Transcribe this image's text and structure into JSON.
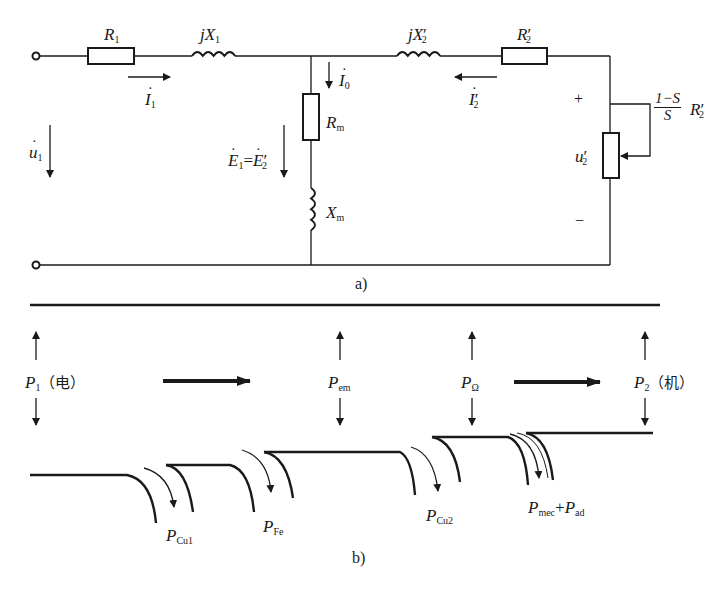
{
  "figure": {
    "part_a": {
      "caption": "a)",
      "title": "T-type equivalent circuit of induction motor",
      "components": {
        "R1": {
          "base": "R",
          "sub": "1"
        },
        "jX1": {
          "base": "jX",
          "sub": "1"
        },
        "jX2p": {
          "base": "jX",
          "sub": "2",
          "prime": "′"
        },
        "R2p": {
          "base": "R",
          "sub": "2",
          "prime": "′"
        },
        "Rm": {
          "base": "R",
          "sub": "m"
        },
        "Xm": {
          "base": "X",
          "sub": "m"
        },
        "load": {
          "num": "1−S",
          "den": "S",
          "base": "R",
          "sub": "2",
          "prime": "′"
        }
      },
      "currents": {
        "I1": {
          "base": "I",
          "sub": "1"
        },
        "I0": {
          "base": "I",
          "sub": "0"
        },
        "I2p": {
          "base": "I",
          "sub": "2",
          "prime": "′"
        }
      },
      "voltages": {
        "U1": {
          "base": "u",
          "sub": "1"
        },
        "E": {
          "lhs_base": "E",
          "lhs_sub": "1",
          "eq": "=",
          "rhs_base": "E",
          "rhs_sub": "2",
          "rhs_prime": "′"
        },
        "U2p": {
          "base": "u",
          "sub": "2",
          "prime": "′"
        },
        "plus": "+",
        "minus": "−"
      }
    },
    "part_b": {
      "caption": "b)",
      "title": "Power flow diagram",
      "nodes": [
        {
          "base": "P",
          "sub": "1",
          "note": "（电）"
        },
        {
          "base": "P",
          "sub": "em"
        },
        {
          "base": "P",
          "sub": "Ω"
        },
        {
          "base": "P",
          "sub": "2",
          "note": "（机）"
        }
      ],
      "losses": [
        {
          "base": "P",
          "sub": "Cu1"
        },
        {
          "base": "P",
          "sub": "Fe"
        },
        {
          "base": "P",
          "sub": "Cu2"
        },
        {
          "base": "P",
          "sub": "mec",
          "plus": "+",
          "base2": "P",
          "sub2": "ad"
        }
      ]
    },
    "stroke_color": "#1a1a1a",
    "background": "#ffffff"
  }
}
